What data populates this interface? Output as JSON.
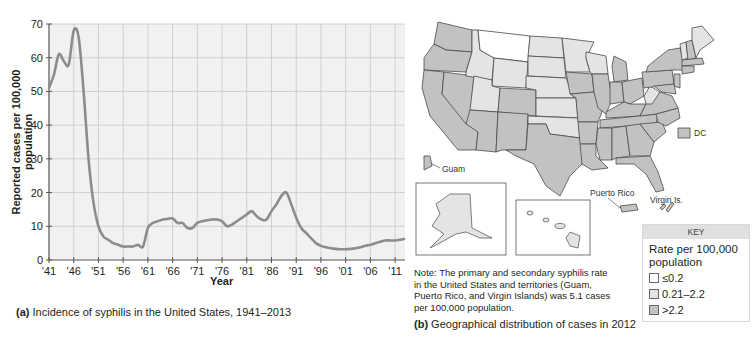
{
  "panel_a": {
    "caption_letter": "(a)",
    "caption_text": " Incidence of syphilis in the United States, 1941–2013",
    "ylabel": "Reported cases per 100,000 population",
    "xlabel": "Year"
  },
  "panel_b": {
    "caption_letter": "(b)",
    "caption_text": " Geographical distribution of cases in 2012",
    "note": "Note: The primary and secondary syphilis rate in the United States and territories (Guam, Puerto Rico, and Virgin Islands) was 5.1 cases per 100,000 population.",
    "labels": {
      "guam": "Guam",
      "dc": "DC",
      "puerto_rico": "Puerto Rico",
      "virgin_islands": "Virgin Is."
    },
    "key": {
      "header": "KEY",
      "title": "Rate per 100,000 population",
      "items": [
        {
          "label": "≤0.2",
          "color": "#ffffff"
        },
        {
          "label": "0.21–2.2",
          "color": "#e4e4e4"
        },
        {
          "label": ">2.2",
          "color": "#c2c2c2"
        }
      ]
    },
    "colors": {
      "low": "#ffffff",
      "mid": "#e4e4e4",
      "high": "#c2c2c2",
      "border": "#4a4a4a"
    }
  },
  "chart_data": {
    "type": "line",
    "title": "Incidence of syphilis in the United States, 1941–2013",
    "xlabel": "Year",
    "ylabel": "Reported cases per 100,000 population",
    "ylim": [
      0,
      70
    ],
    "yticks": [
      0,
      10,
      20,
      30,
      40,
      50,
      60,
      70
    ],
    "xlim": [
      1941,
      2013
    ],
    "xtick_labels": [
      "'41",
      "'46",
      "'51",
      "'56",
      "'61",
      "'66",
      "'71",
      "'76",
      "'81",
      "'86",
      "'91",
      "'96",
      "'01",
      "'06",
      "'11"
    ],
    "xtick_years": [
      1941,
      1946,
      1951,
      1956,
      1961,
      1966,
      1971,
      1976,
      1981,
      1986,
      1991,
      1996,
      2001,
      2006,
      2011
    ],
    "grid": true,
    "line_color": "#8c8c8c",
    "plot_bg": "#f1f1f1",
    "series": [
      {
        "name": "Reported cases per 100,000",
        "x": [
          1941,
          1942,
          1943,
          1944,
          1945,
          1946,
          1947,
          1948,
          1949,
          1950,
          1951,
          1952,
          1953,
          1954,
          1955,
          1956,
          1957,
          1958,
          1959,
          1960,
          1961,
          1962,
          1963,
          1964,
          1965,
          1966,
          1967,
          1968,
          1969,
          1970,
          1971,
          1972,
          1973,
          1974,
          1975,
          1976,
          1977,
          1978,
          1979,
          1980,
          1981,
          1982,
          1983,
          1984,
          1985,
          1986,
          1987,
          1988,
          1989,
          1990,
          1991,
          1992,
          1993,
          1994,
          1995,
          1996,
          1997,
          1998,
          1999,
          2000,
          2001,
          2002,
          2003,
          2004,
          2005,
          2006,
          2007,
          2008,
          2009,
          2010,
          2011,
          2012,
          2013
        ],
        "values": [
          51,
          55,
          61,
          59,
          58,
          68,
          66,
          50,
          30,
          17,
          10,
          7,
          6,
          5,
          4.5,
          4,
          4,
          4,
          4.5,
          4,
          9.5,
          11,
          11.5,
          12,
          12.2,
          12.3,
          11,
          11,
          9.5,
          9.5,
          11,
          11.5,
          11.8,
          12,
          12,
          11.5,
          10,
          10.5,
          11.5,
          12.5,
          13.5,
          14.5,
          13,
          12,
          12,
          14.5,
          16.5,
          19,
          20,
          16.5,
          12.5,
          9.5,
          8,
          6.5,
          5,
          4.2,
          3.8,
          3.5,
          3.3,
          3.2,
          3.2,
          3.3,
          3.5,
          3.8,
          4.2,
          4.5,
          5,
          5.4,
          5.8,
          5.8,
          5.8,
          6.0,
          6.3
        ]
      }
    ]
  }
}
